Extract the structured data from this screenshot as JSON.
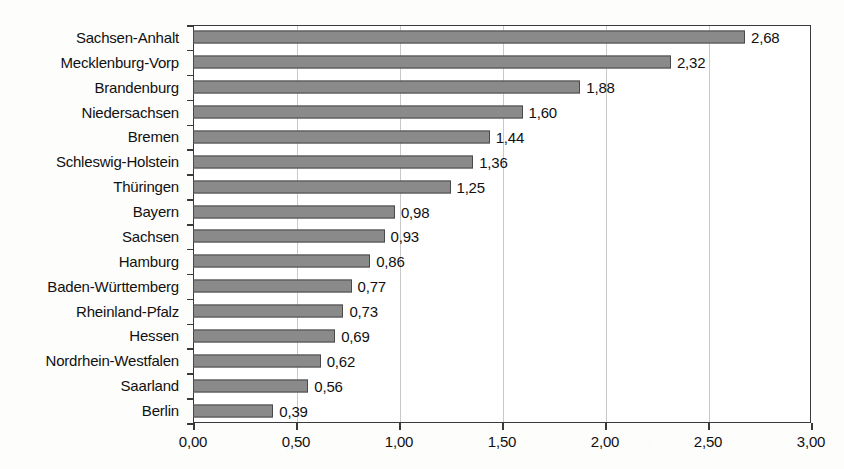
{
  "chart_data": {
    "type": "bar",
    "orientation": "horizontal",
    "title": "",
    "subtitle": "",
    "xlabel": "",
    "ylabel": "",
    "xlim": [
      0,
      3
    ],
    "xticks": [
      "0,00",
      "0,50",
      "1,00",
      "1,50",
      "2,00",
      "2,50",
      "3,00"
    ],
    "xtick_values": [
      0,
      0.5,
      1,
      1.5,
      2,
      2.5,
      3
    ],
    "grid": "vertical",
    "legend": "none",
    "decimal_separator": ",",
    "categories": [
      "Sachsen-Anhalt",
      "Mecklenburg-Vorp",
      "Brandenburg",
      "Niedersachsen",
      "Bremen",
      "Schleswig-Holstein",
      "Thüringen",
      "Bayern",
      "Sachsen",
      "Hamburg",
      "Baden-Württemberg",
      "Rheinland-Pfalz",
      "Hessen",
      "Nordrhein-Westfalen",
      "Saarland",
      "Berlin"
    ],
    "values": [
      2.68,
      2.32,
      1.88,
      1.6,
      1.44,
      1.36,
      1.25,
      0.98,
      0.93,
      0.86,
      0.77,
      0.73,
      0.69,
      0.62,
      0.56,
      0.39
    ],
    "value_labels": [
      "2,68",
      "2,32",
      "1,88",
      "1,60",
      "1,44",
      "1,36",
      "1,25",
      "0,98",
      "0,93",
      "0,86",
      "0,77",
      "0,73",
      "0,69",
      "0,62",
      "0,56",
      "0,39"
    ],
    "bar_color": "#8a8a8a",
    "bar_border_color": "#4a4a4a",
    "grid_color": "#c9c9c9",
    "axis_color": "#3a3a3a",
    "plot_background": "#ffffff"
  }
}
